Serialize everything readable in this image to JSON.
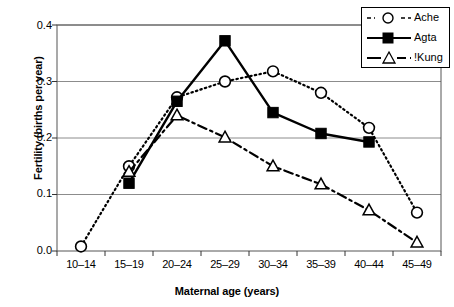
{
  "chart_data": {
    "type": "line",
    "title": "",
    "xlabel": "Maternal age (years)",
    "ylabel": "Fertility (births per year)",
    "categories": [
      "10–14",
      "15–19",
      "20–24",
      "25–29",
      "30–34",
      "35–39",
      "40–44",
      "45–49"
    ],
    "ylim": [
      0.0,
      0.4
    ],
    "yticks": [
      "0.0",
      "0.1",
      "0.2",
      "0.3",
      "0.4"
    ],
    "ytick_values": [
      0.0,
      0.1,
      0.2,
      0.3,
      0.4
    ],
    "grid": "horizontal",
    "legend_position": "top-right",
    "series": [
      {
        "name": "Ache",
        "marker": "open-circle",
        "line_style": "dotted",
        "color": "#000000",
        "values": [
          0.008,
          0.15,
          0.272,
          0.3,
          0.318,
          0.28,
          0.218,
          0.068
        ]
      },
      {
        "name": "Agta",
        "marker": "filled-square",
        "line_style": "solid",
        "color": "#000000",
        "values": [
          null,
          0.12,
          0.265,
          0.372,
          0.245,
          0.208,
          0.193,
          null
        ]
      },
      {
        "name": "!Kung",
        "marker": "open-triangle",
        "line_style": "dash-dot",
        "color": "#000000",
        "values": [
          null,
          0.14,
          0.24,
          0.201,
          0.15,
          0.118,
          0.072,
          0.015
        ]
      }
    ]
  },
  "axis": {
    "y_label": "Fertility (births per year)",
    "x_label": "Maternal age (years)",
    "y_ticks": [
      "0.0",
      "0.1",
      "0.2",
      "0.3",
      "0.4"
    ],
    "x_ticks": [
      "10–14",
      "15–19",
      "20–24",
      "25–29",
      "30–34",
      "35–39",
      "40–44",
      "45–49"
    ]
  },
  "legend": {
    "items": [
      {
        "label": "Ache"
      },
      {
        "label": "Agta"
      },
      {
        "label": "!Kung"
      }
    ]
  },
  "colors": {
    "foreground": "#000000",
    "grid": "#8c8c8c",
    "background": "#ffffff"
  }
}
